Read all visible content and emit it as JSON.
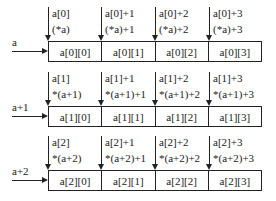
{
  "rows": [
    {
      "label": "a",
      "pointers": [
        {
          "line1": "a[0]",
          "line2": "(*a)"
        },
        {
          "line1": "a[0]+1",
          "line2": "(*a)+1"
        },
        {
          "line1": "a[0]+2",
          "line2": "(*a)+2"
        },
        {
          "line1": "a[0]+3",
          "line2": "(*a)+3"
        }
      ],
      "cells": [
        "a[0][0]",
        "a[0][1]",
        "a[0][2]",
        "a[0][3]"
      ]
    },
    {
      "label": "a+1",
      "pointers": [
        {
          "line1": "a[1]",
          "line2": "*(a+1)"
        },
        {
          "line1": "a[1]+1",
          "line2": "*(a+1)+1"
        },
        {
          "line1": "a[1]+2",
          "line2": "*(a+1)+2"
        },
        {
          "line1": "a[1]+3",
          "line2": "*(a+1)+3"
        }
      ],
      "cells": [
        "a[1][0]",
        "a[1][1]",
        "a[1][2]",
        "a[1][3]"
      ]
    },
    {
      "label": "a+2",
      "pointers": [
        {
          "line1": "a[2]",
          "line2": "*(a+2)"
        },
        {
          "line1": "a[2]+1",
          "line2": "*(a+2)+1"
        },
        {
          "line1": "a[2]+2",
          "line2": "*(a+2)+2"
        },
        {
          "line1": "a[2]+3",
          "line2": "*(a+2)+3"
        }
      ],
      "cells": [
        "a[2][0]",
        "a[2][1]",
        "a[2][2]",
        "a[2][3]"
      ]
    }
  ]
}
